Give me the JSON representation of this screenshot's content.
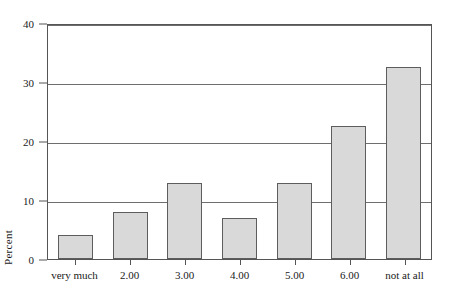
{
  "chart_data": {
    "type": "bar",
    "title": "",
    "subtitle": "",
    "xlabel": "",
    "ylabel": "Percent",
    "categories": [
      "very much",
      "2.00",
      "3.00",
      "4.00",
      "5.00",
      "6.00",
      "not at all"
    ],
    "values": [
      4.0,
      8.0,
      12.8,
      7.0,
      12.8,
      22.5,
      32.5
    ],
    "ylim": [
      0,
      40
    ],
    "ytick_labels": [
      "0",
      "10",
      "20",
      "30",
      "40"
    ],
    "ytick_values": [
      0,
      10,
      20,
      30,
      40
    ],
    "grid": "horizontal",
    "legend": "none",
    "bar_fill_color": "#d9d9d9",
    "bar_border_color": "#5d5d5d",
    "axis_color": "#555555",
    "gridline_color": "#6e6e6e",
    "background_color": "#ffffff"
  }
}
